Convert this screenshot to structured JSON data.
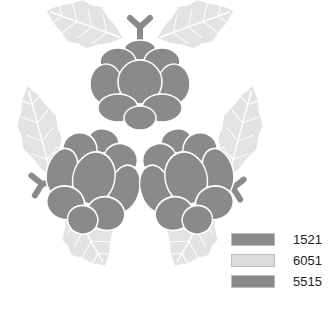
{
  "figure": {
    "colors": {
      "flower": "#8a8a8a",
      "leaf": "#e3e3e3",
      "leaf_vein": "#ffffff",
      "stem": "#8a8a8a",
      "outline": "#ffffff"
    }
  },
  "legend": {
    "items": [
      {
        "label": "1521",
        "color": "#8a8a8a"
      },
      {
        "label": "6051",
        "color": "#dcdcdc"
      },
      {
        "label": "5515",
        "color": "#8a8a8a"
      }
    ]
  }
}
